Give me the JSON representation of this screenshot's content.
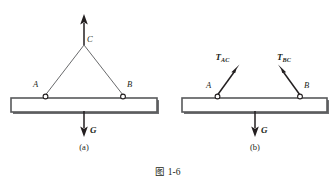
{
  "figure": {
    "caption": "图 1-6",
    "panels": [
      {
        "id": "a",
        "label": "(a)",
        "points": [
          {
            "name": "A",
            "label": "A"
          },
          {
            "name": "B",
            "label": "B"
          },
          {
            "name": "C",
            "label": "C"
          }
        ],
        "forces": [
          {
            "name": "G",
            "label": "G",
            "subscript": "",
            "direction": "down"
          }
        ],
        "members": [
          "cable-AC",
          "cable-BC",
          "lifting-rope-C",
          "beam"
        ]
      },
      {
        "id": "b",
        "label": "(b)",
        "points": [
          {
            "name": "A",
            "label": "A"
          },
          {
            "name": "B",
            "label": "B"
          }
        ],
        "forces": [
          {
            "name": "T_AC",
            "label": "T",
            "subscript": "AC",
            "direction": "up-right"
          },
          {
            "name": "T_BC",
            "label": "T",
            "subscript": "BC",
            "direction": "up-left"
          },
          {
            "name": "G",
            "label": "G",
            "subscript": "",
            "direction": "down"
          }
        ],
        "members": [
          "beam"
        ]
      }
    ]
  },
  "colors": {
    "ink": "#231f20",
    "beam_stroke": "#58595b",
    "beam_shadow": "#6d6e71",
    "background": "#ffffff"
  }
}
